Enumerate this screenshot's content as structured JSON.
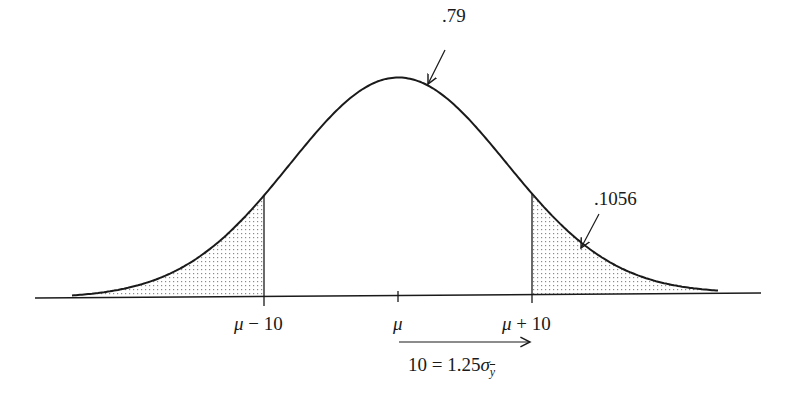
{
  "diagram": {
    "type": "normal-distribution-curve",
    "curve": {
      "mean_label": "μ",
      "peak_x": 398,
      "peak_y": 78,
      "baseline_y": 296,
      "sigma_px": 108,
      "line_color": "#1a1a1a"
    },
    "annotations": {
      "center_area": ".79",
      "right_tail_area": ".1056"
    },
    "axis_labels": {
      "left_bound": {
        "mu": "μ",
        "op": " − 10"
      },
      "center": "μ",
      "right_bound": {
        "mu": "μ",
        "op": " + 10"
      }
    },
    "arrow_caption": {
      "prefix": "10 = 1.25",
      "sigma": "σ",
      "subscript": "y"
    },
    "shading": {
      "left_tail": true,
      "right_tail": true,
      "pattern": "dotted",
      "dot_color": "#8a8a8a"
    },
    "bounds_x": {
      "left": 264,
      "center": 398,
      "right": 532
    }
  }
}
